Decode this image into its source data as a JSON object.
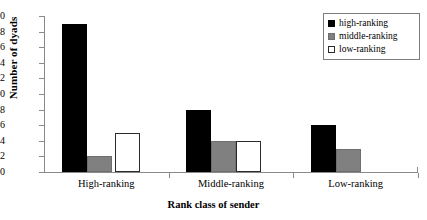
{
  "chart_data": {
    "type": "bar",
    "title": "",
    "xlabel": "Rank class of sender",
    "ylabel": "Number of dyads",
    "categories": [
      "High-ranking",
      "Middle-ranking",
      "Low-ranking"
    ],
    "series": [
      {
        "name": "high-ranking",
        "values": [
          19,
          8,
          6
        ],
        "color": "#000000"
      },
      {
        "name": "middle-ranking",
        "values": [
          2,
          4,
          3
        ],
        "color": "#808080"
      },
      {
        "name": "low-ranking",
        "values": [
          5,
          4,
          0
        ],
        "color": "#ffffff"
      }
    ],
    "ylim": [
      0,
      20
    ],
    "yticks": [
      0,
      2,
      4,
      6,
      8,
      10,
      12,
      14,
      16,
      18,
      20
    ],
    "ytick_labels": [
      "0",
      "2",
      "4",
      "6",
      "8",
      "10",
      "12",
      "14",
      "16",
      "18",
      "20"
    ],
    "grid": false,
    "legend_position": "top-right"
  },
  "legend": {
    "entries": [
      {
        "label": "high-ranking"
      },
      {
        "label": "middle-ranking"
      },
      {
        "label": "low-ranking"
      }
    ]
  }
}
